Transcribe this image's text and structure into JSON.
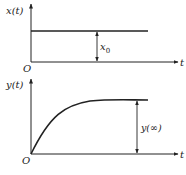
{
  "top_plot": {
    "y_label": "x(t)",
    "x_label": "t",
    "origin_label": "O",
    "level_label": "x",
    "level_subscript": "0",
    "description": "step input of constant amplitude x0"
  },
  "bottom_plot": {
    "y_label": "y(t)",
    "x_label": "t",
    "origin_label": "O",
    "steady_state_label": "y(∞)",
    "description": "first-order response rising exponentially to y(∞)"
  },
  "colors": {
    "stroke": "#222222",
    "background": "#ffffff"
  }
}
